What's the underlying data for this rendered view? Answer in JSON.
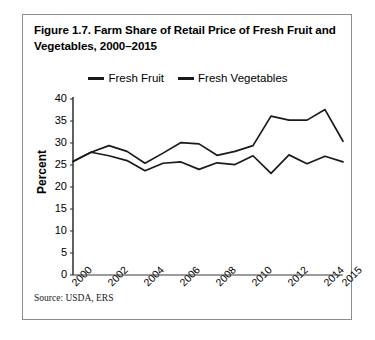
{
  "figure": {
    "title": "Figure 1.7. Farm Share of Retail Price of Fresh Fruit and Vegetables, 2000–2015",
    "source": "Source: USDA, ERS"
  },
  "chart_data": {
    "type": "line",
    "title": "Figure 1.7. Farm Share of Retail Price of Fresh Fruit and Vegetables, 2000–2015",
    "xlabel": "",
    "ylabel": "Percent",
    "ylim": [
      0,
      40
    ],
    "ytick_step": 5,
    "yticks": [
      40,
      35,
      30,
      25,
      20,
      15,
      10,
      5,
      0
    ],
    "xlim": [
      2000,
      2015
    ],
    "x": [
      2000,
      2001,
      2002,
      2003,
      2004,
      2005,
      2006,
      2007,
      2008,
      2009,
      2010,
      2011,
      2012,
      2013,
      2014,
      2015
    ],
    "xticks": [
      2000,
      2002,
      2004,
      2006,
      2008,
      2010,
      2012,
      2014,
      2015
    ],
    "xtick_labels": [
      "2000",
      "2002",
      "2004",
      "2006",
      "2008",
      "2010",
      "2012",
      "2014",
      "2015"
    ],
    "grid": false,
    "legend_position": "top-center",
    "series": [
      {
        "name": "Fresh Fruit",
        "color": "#1a1a1a",
        "values": [
          25.8,
          27.9,
          29.4,
          28.1,
          25.4,
          27.7,
          30.1,
          29.8,
          27.2,
          28.1,
          29.4,
          36.1,
          35.2,
          35.2,
          37.6,
          30.4
        ]
      },
      {
        "name": "Fresh Vegetables",
        "color": "#1a1a1a",
        "values": [
          25.8,
          27.9,
          27.1,
          26.0,
          23.7,
          25.4,
          25.7,
          24.0,
          25.5,
          25.1,
          27.1,
          23.1,
          27.3,
          25.3,
          27.0,
          25.7
        ]
      }
    ]
  },
  "legend": {
    "items": [
      {
        "label": "Fresh Fruit"
      },
      {
        "label": "Fresh Vegetables"
      }
    ]
  },
  "axis": {
    "y_title": "Percent"
  }
}
